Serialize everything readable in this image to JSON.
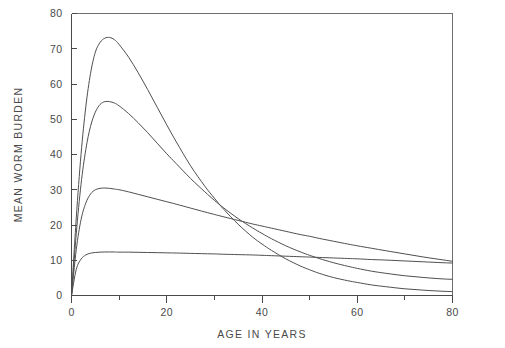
{
  "chart_data": {
    "type": "line",
    "title": "",
    "xlabel": "AGE IN YEARS",
    "ylabel": "MEAN WORM BURDEN",
    "xlim": [
      0,
      80
    ],
    "ylim": [
      0,
      80
    ],
    "xticks": [
      0,
      20,
      40,
      60,
      80
    ],
    "xtick_labels": [
      "0",
      "20",
      "40",
      "60",
      "80"
    ],
    "xticks_minor": [
      10,
      30,
      50,
      70
    ],
    "yticks": [
      0,
      10,
      20,
      30,
      40,
      50,
      60,
      70,
      80
    ],
    "ytick_labels": [
      "0",
      "10",
      "20",
      "30",
      "40",
      "50",
      "60",
      "70",
      "80"
    ],
    "grid": false,
    "legend": "none",
    "x": [
      0,
      1,
      2,
      3,
      4,
      5,
      6,
      7,
      8,
      9,
      10,
      12,
      14,
      16,
      18,
      20,
      22,
      25,
      28,
      30,
      32,
      35,
      38,
      40,
      42,
      45,
      48,
      50,
      52,
      55,
      58,
      60,
      63,
      66,
      70,
      74,
      78,
      80
    ],
    "series": [
      {
        "name": "curve-1",
        "peak_value": 73,
        "peak_age": 8,
        "end_value": 1,
        "values": [
          0,
          22.0,
          40.0,
          53.5,
          63.0,
          69.0,
          71.8,
          73.0,
          73.2,
          72.6,
          71.2,
          67.6,
          63.2,
          58.4,
          53.4,
          48.4,
          43.6,
          36.8,
          31.0,
          27.6,
          24.4,
          20.2,
          16.6,
          14.6,
          12.8,
          10.4,
          8.4,
          7.3,
          6.3,
          5.1,
          4.2,
          3.7,
          3.0,
          2.5,
          1.9,
          1.5,
          1.2,
          1.1
        ]
      },
      {
        "name": "curve-2",
        "peak_value": 55,
        "peak_age": 8,
        "end_value": 5,
        "values": [
          0,
          17.5,
          31.5,
          41.4,
          48.0,
          52.0,
          54.2,
          55.0,
          55.0,
          54.6,
          53.8,
          51.6,
          49.0,
          46.2,
          43.2,
          40.2,
          37.4,
          33.2,
          29.4,
          27.0,
          24.8,
          21.8,
          19.2,
          17.6,
          16.1,
          14.1,
          12.4,
          11.4,
          10.5,
          9.3,
          8.3,
          7.7,
          6.9,
          6.3,
          5.6,
          5.1,
          4.7,
          4.6
        ]
      },
      {
        "name": "curve-3",
        "peak_value": 30.5,
        "peak_age": 7,
        "end_value": 8,
        "values": [
          0,
          13.0,
          21.5,
          26.2,
          28.8,
          30.0,
          30.4,
          30.5,
          30.4,
          30.2,
          30.0,
          29.4,
          28.7,
          28.0,
          27.3,
          26.6,
          25.9,
          24.8,
          23.7,
          23.0,
          22.3,
          21.3,
          20.3,
          19.7,
          19.1,
          18.2,
          17.3,
          16.8,
          16.2,
          15.4,
          14.6,
          14.1,
          13.4,
          12.7,
          11.8,
          10.9,
          10.1,
          9.7
        ]
      },
      {
        "name": "curve-4",
        "peak_value": 12.3,
        "peak_age": 7,
        "end_value": 9.5,
        "values": [
          0,
          7.4,
          10.3,
          11.5,
          12.0,
          12.2,
          12.3,
          12.35,
          12.35,
          12.35,
          12.3,
          12.3,
          12.25,
          12.2,
          12.15,
          12.1,
          12.05,
          11.95,
          11.85,
          11.8,
          11.7,
          11.6,
          11.5,
          11.4,
          11.3,
          11.15,
          11.0,
          10.9,
          10.8,
          10.65,
          10.5,
          10.4,
          10.2,
          10.05,
          9.8,
          9.55,
          9.3,
          9.2
        ]
      }
    ]
  },
  "style": {
    "axis_color": "#4a4a4a",
    "curve_color": "#4f4f4f",
    "frame_color": "#6f6f6f",
    "background": "#ffffff"
  }
}
